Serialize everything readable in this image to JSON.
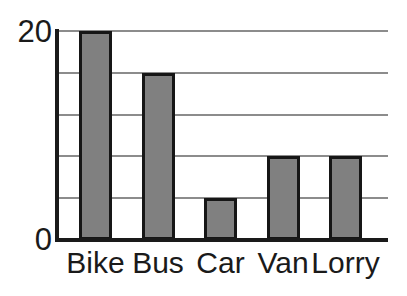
{
  "chart_data": {
    "type": "bar",
    "title": "",
    "subtitle": "",
    "xlabel": "",
    "ylabel": "",
    "categories": [
      "Bike",
      "Bus",
      "Car",
      "Van",
      "Lorry"
    ],
    "values": [
      20,
      16,
      4,
      8,
      8
    ],
    "ylim": [
      0,
      20
    ],
    "ytick_values": [
      0,
      4,
      8,
      12,
      16,
      20
    ],
    "ytick_labels_shown": [
      "0",
      "20"
    ],
    "gridlines": true,
    "gridline_orientation": "horizontal",
    "legend": null,
    "legend_position": "none",
    "annotations": [],
    "bar_fill_color": "#808080",
    "bar_border_color": "#161616",
    "gridline_color": "#8c8c8c",
    "axis_color": "#1a1a1a",
    "background_color": "#ffffff"
  },
  "axes": {
    "y": {
      "label_top": "20",
      "label_bottom": "0"
    },
    "x": {
      "tick_labels": [
        "Bike",
        "Bus",
        "Car",
        "Van",
        "Lorry"
      ]
    }
  }
}
